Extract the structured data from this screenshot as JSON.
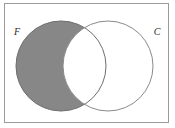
{
  "figure": {
    "type": "venn-diagram",
    "caption_alt": "Two-set Venn diagram with set F shaded excluding the intersection",
    "background_color": "#ffffff"
  },
  "universe": {
    "name": "universal-set-frame",
    "shape": "rectangle",
    "x": 4.5,
    "y": 3.5,
    "width": 164,
    "height": 119,
    "stroke_color": "#9a9a9a",
    "stroke_width": 1,
    "fill_color": "#ffffff"
  },
  "sets": [
    {
      "id": "F",
      "label": "F",
      "label_x": 17,
      "label_y": 35,
      "cx": 61,
      "cy": 66,
      "r": 45,
      "stroke_color": "#6e6e6e",
      "stroke_width": 1,
      "fill_color": "#878787",
      "shaded": true
    },
    {
      "id": "C",
      "label": "C",
      "label_x": 157,
      "label_y": 35,
      "cx": 108,
      "cy": 66,
      "r": 45,
      "stroke_color": "#8a8a8a",
      "stroke_width": 1,
      "fill_color": "#ffffff",
      "shaded": false
    }
  ],
  "regions": {
    "f_only": {
      "name": "F-minus-C",
      "fill_color": "#878787",
      "shaded": true
    },
    "intersection": {
      "name": "F-intersect-C",
      "fill_color": "#ffffff",
      "shaded": false
    },
    "c_only": {
      "name": "C-minus-F",
      "fill_color": "#ffffff",
      "shaded": false
    },
    "outside": {
      "name": "outside-both-sets",
      "fill_color": "#ffffff",
      "shaded": false
    }
  },
  "colors": {
    "shade_gray": "#878787",
    "frame_gray": "#9a9a9a",
    "circle_outline": "#7d7d7d",
    "label_ink": "#2b2b2b",
    "paper_white": "#ffffff"
  }
}
